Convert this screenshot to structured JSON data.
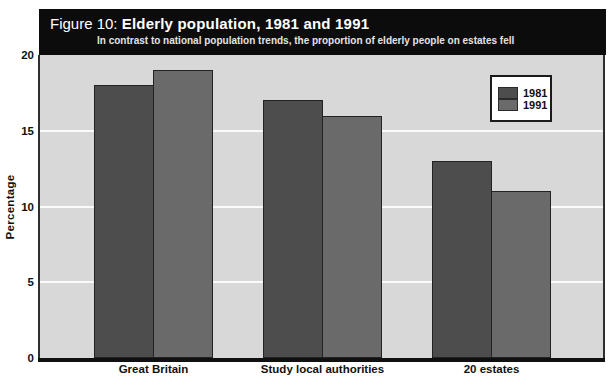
{
  "figure": {
    "label": "Figure 10:",
    "title": "Elderly population, 1981 and 1991",
    "subtitle": "In contrast to national population trends, the proportion of elderly people on estates fell"
  },
  "chart_data": {
    "type": "bar",
    "title": "Figure 10: Elderly population, 1981 and 1991",
    "subtitle": "In contrast to national population trends, the proportion of elderly people on estates fell",
    "categories": [
      "Great Britain",
      "Study local authorities",
      "20 estates"
    ],
    "series": [
      {
        "name": "1981",
        "values": [
          18,
          17,
          13
        ],
        "color": "#4d4d4d"
      },
      {
        "name": "1991",
        "values": [
          19,
          16,
          11
        ],
        "color": "#6a6a6a"
      }
    ],
    "xlabel": "",
    "ylabel": "Percentage",
    "ylim": [
      0,
      20
    ],
    "yticks": [
      0,
      5,
      10,
      15,
      20
    ],
    "grid": "horizontal-white-lines",
    "legend_position": "top-right",
    "plot_background": "#d8d8d8",
    "gridline_color": "#fefefe",
    "header_background": "#0c0c0c"
  },
  "legend": {
    "items": [
      {
        "label": "1981",
        "color": "#4d4d4d"
      },
      {
        "label": "1991",
        "color": "#6a6a6a"
      }
    ]
  }
}
